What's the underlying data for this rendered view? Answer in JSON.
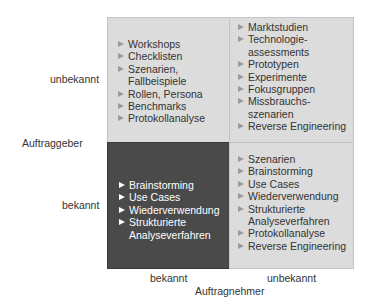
{
  "axes": {
    "y_title": "Auftraggeber",
    "x_title": "Auftragnehmer",
    "y_top": "unbekannt",
    "y_bottom": "bekannt",
    "x_left": "bekannt",
    "x_right": "unbekannt"
  },
  "quadrants": {
    "top_left": {
      "items": [
        "Workshops",
        "Checklisten",
        "Szenarien,\nFallbeispiele",
        "Rollen, Persona",
        "Benchmarks",
        "Protokollanalyse"
      ]
    },
    "top_right": {
      "items": [
        "Marktstudien",
        "Technologie-\nassessments",
        "Prototypen",
        "Experimente",
        "Fokusgruppen",
        "Missbrauchs-\nszenarien",
        "Reverse Engineering"
      ]
    },
    "bottom_left": {
      "items": [
        "Brainstorming",
        "Use Cases",
        "Wiederverwendung",
        "Strukturierte\nAnalyseverfahren"
      ]
    },
    "bottom_right": {
      "items": [
        "Szenarien",
        "Brainstorming",
        "Use Cases",
        "Wiederverwendung",
        "Strukturierte\nAnalyseverfahren",
        "Protokollanalyse",
        "Reverse Engineering"
      ]
    }
  },
  "colors": {
    "light_quadrant": "#dcdcdc",
    "dark_quadrant": "#4a4a4a",
    "bullet_light": "#9a9a9a",
    "bullet_dark": "#ffffff"
  }
}
